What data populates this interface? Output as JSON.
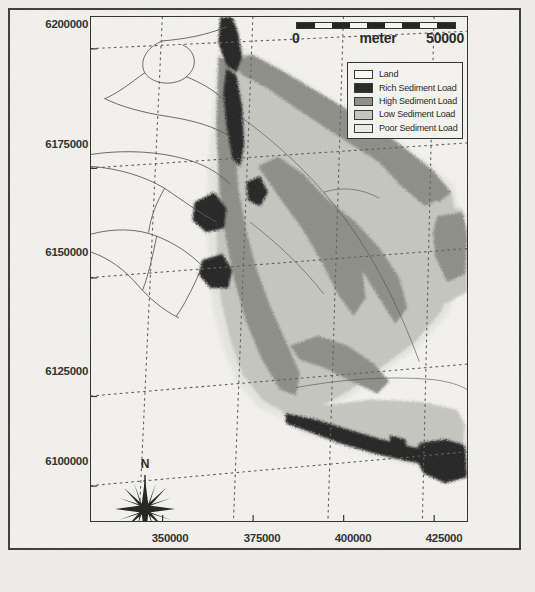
{
  "map": {
    "title": "Sediment Load Map",
    "projection_units": "meter",
    "y_axis": {
      "ticks": [
        "6200000",
        "6175000",
        "6150000",
        "6125000",
        "6100000"
      ],
      "values": [
        6200000,
        6175000,
        6150000,
        6125000,
        6100000
      ]
    },
    "x_axis": {
      "ticks": [
        "350000",
        "375000",
        "400000",
        "425000"
      ],
      "values": [
        350000,
        375000,
        400000,
        425000
      ]
    },
    "scalebar": {
      "min_label": "0",
      "unit_label": "meter",
      "max_label": "50000",
      "min_value": 0,
      "max_value": 50000,
      "segments": [
        "#1d1d1b",
        "#f7f7f3",
        "#1d1d1b",
        "#f7f7f3",
        "#1d1d1b",
        "#f7f7f3",
        "#1d1d1b",
        "#f7f7f3",
        "#1d1d1b"
      ]
    },
    "north_arrow": {
      "label": "N"
    },
    "legend": {
      "items": [
        {
          "label": "Land",
          "color": "#fbfbf7"
        },
        {
          "label": "Rich Sediment Load",
          "color": "#232321"
        },
        {
          "label": "High Sediment Load",
          "color": "#8d8d87"
        },
        {
          "label": "Low Sediment Load",
          "color": "#c6c6bf"
        },
        {
          "label": "Poor Sediment Load",
          "color": "#eeeee8"
        }
      ]
    },
    "colors": {
      "land": "#f4f3ef",
      "rich": "#232321",
      "high": "#8d8d87",
      "low": "#c6c6bf",
      "poor": "#e6e6df",
      "frame": "#2e2e2c",
      "graticule": "#6a6a64",
      "river": "#555551",
      "text": "#24241f"
    }
  },
  "chart_data": {
    "type": "map",
    "xlabel": "",
    "ylabel": "",
    "xlim": [
      338000,
      436000
    ],
    "ylim": [
      6088000,
      6206000
    ],
    "x_ticks": [
      350000,
      375000,
      400000,
      425000
    ],
    "y_ticks": [
      6100000,
      6125000,
      6150000,
      6175000,
      6200000
    ],
    "grid": true,
    "grid_style": "dotted graticule, slightly rotated",
    "legend_position": "top-right inside map frame",
    "units": "meter",
    "scale_bar": {
      "from": 0,
      "to": 50000,
      "unit": "meter"
    },
    "classes": [
      {
        "name": "Land",
        "color": "#fbfbf7",
        "rank": 0
      },
      {
        "name": "Rich Sediment Load",
        "color": "#232321",
        "rank": 4
      },
      {
        "name": "High Sediment Load",
        "color": "#8d8d87",
        "rank": 3
      },
      {
        "name": "Low Sediment Load",
        "color": "#c6c6bf",
        "rank": 2
      },
      {
        "name": "Poor Sediment Load",
        "color": "#eeeee8",
        "rank": 1
      }
    ]
  }
}
